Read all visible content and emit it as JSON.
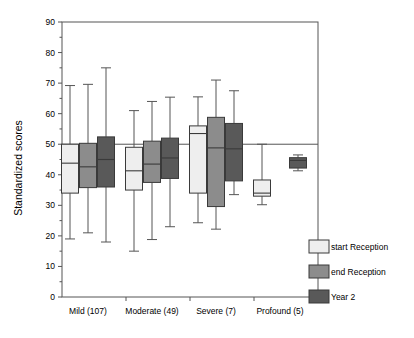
{
  "chart_data": {
    "type": "box",
    "title": "",
    "xlabel": "",
    "ylabel": "Standardized scores",
    "ylim": [
      0,
      90
    ],
    "yticks": [
      0,
      10,
      20,
      30,
      40,
      50,
      60,
      70,
      80,
      90
    ],
    "ytick_labels": [
      "0",
      "10",
      "20",
      "30",
      "40",
      "50",
      "60",
      "70",
      "80",
      "90"
    ],
    "minor_tick_step": 5,
    "grid": false,
    "reference_line": 50,
    "categories": [
      "Mild (107)",
      "Moderate (49)",
      "Severe (7)",
      "Profound (5)"
    ],
    "legend_position": "right",
    "series": [
      {
        "name": "start Reception",
        "color": "#eeeeee",
        "boxes": [
          {
            "category": "Mild (107)",
            "whisker_low": 19.0,
            "q1": 34.0,
            "median": 43.8,
            "q3": 50.0,
            "whisker_high": 69.2
          },
          {
            "category": "Moderate (49)",
            "whisker_low": 15.0,
            "q1": 35.0,
            "median": 41.3,
            "q3": 49.0,
            "whisker_high": 61.0
          },
          {
            "category": "Severe (7)",
            "whisker_low": 24.3,
            "q1": 34.0,
            "median": 53.5,
            "q3": 56.0,
            "whisker_high": 65.5
          },
          {
            "category": "Profound (5)",
            "whisker_low": 30.2,
            "q1": 33.0,
            "median": 34.0,
            "q3": 38.3,
            "whisker_high": 50.0
          }
        ]
      },
      {
        "name": "end Reception",
        "color": "#8c8c8c",
        "boxes": [
          {
            "category": "Mild (107)",
            "whisker_low": 21.0,
            "q1": 35.8,
            "median": 42.6,
            "q3": 50.3,
            "whisker_high": 69.6
          },
          {
            "category": "Moderate (49)",
            "whisker_low": 18.8,
            "q1": 37.5,
            "median": 43.5,
            "q3": 51.0,
            "whisker_high": 64.0
          },
          {
            "category": "Severe (7)",
            "whisker_low": 22.2,
            "q1": 29.6,
            "median": 48.8,
            "q3": 58.8,
            "whisker_high": 71.0
          },
          {
            "category": "Profound (5)",
            "whisker_low": null,
            "q1": null,
            "median": null,
            "q3": null,
            "whisker_high": null
          }
        ]
      },
      {
        "name": "Year 2",
        "color": "#595959",
        "boxes": [
          {
            "category": "Mild (107)",
            "whisker_low": 18.0,
            "q1": 36.0,
            "median": 45.0,
            "q3": 52.4,
            "whisker_high": 75.0
          },
          {
            "category": "Moderate (49)",
            "whisker_low": 23.0,
            "q1": 38.8,
            "median": 45.5,
            "q3": 52.0,
            "whisker_high": 65.4
          },
          {
            "category": "Severe (7)",
            "whisker_low": 33.5,
            "q1": 38.0,
            "median": 48.5,
            "q3": 56.8,
            "whisker_high": 67.5
          },
          {
            "category": "Profound (5)",
            "whisker_low": 41.3,
            "q1": 42.2,
            "median": 44.7,
            "q3": 45.6,
            "whisker_high": 46.5
          }
        ]
      }
    ]
  },
  "axis": {
    "y_title": "Standardized scores",
    "y_labels": [
      "90",
      "80",
      "70",
      "60",
      "50",
      "40",
      "30",
      "20",
      "10",
      "0"
    ],
    "x_labels": [
      "Mild (107)",
      "Moderate (49)",
      "Severe (7)",
      "Profound (5)"
    ]
  },
  "legend": {
    "items": [
      {
        "label": "start Reception",
        "color": "#eeeeee"
      },
      {
        "label": "end Reception",
        "color": "#8c8c8c"
      },
      {
        "label": "Year 2",
        "color": "#595959"
      }
    ]
  }
}
